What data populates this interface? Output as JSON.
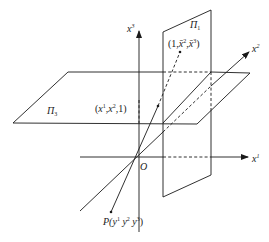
{
  "figure": {
    "type": "projective-coordinate-diagram",
    "colors": {
      "line": "#1a1a1a",
      "background": "#ffffff"
    },
    "origin": {
      "label": "O"
    },
    "axes": [
      {
        "id": "x1",
        "base": "x",
        "sup": "1",
        "direction": "right"
      },
      {
        "id": "x2",
        "base": "x",
        "sup": "2",
        "direction": "diagonal-up-right"
      },
      {
        "id": "x3",
        "base": "x",
        "sup": "3",
        "direction": "up"
      }
    ],
    "planes": [
      {
        "id": "pi1",
        "base": "Π",
        "sub": "1",
        "orientation": "vertical"
      },
      {
        "id": "pi3",
        "base": "Π",
        "sub": "3",
        "orientation": "horizontal"
      }
    ],
    "points": [
      {
        "id": "p_pi1",
        "label": "(1,x̄²,x̄³)",
        "parts": [
          "(1,",
          "x̄",
          "2",
          ",",
          "x̄",
          "3",
          ")"
        ]
      },
      {
        "id": "p_pi3",
        "label": "(x¹,x²,1)",
        "parts": [
          "(",
          "x",
          "1",
          ",",
          "x",
          "2",
          ",1)"
        ]
      },
      {
        "id": "P",
        "label": "P(y¹,y²,y³)",
        "parts": [
          "P(",
          "y",
          "1",
          " ",
          "y",
          "2",
          " ",
          "y",
          "3",
          ")"
        ]
      }
    ]
  }
}
